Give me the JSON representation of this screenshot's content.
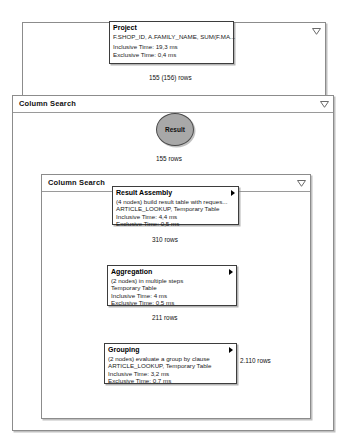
{
  "diagram": {
    "type": "sql-execution-plan",
    "containers": [
      {
        "id": "outer-top",
        "title": "",
        "collapse_icon": "chevron-down-icon"
      },
      {
        "id": "column-search-outer",
        "title": "Column Search",
        "collapse_icon": "chevron-down-icon"
      },
      {
        "id": "column-search-inner",
        "title": "Column Search",
        "collapse_icon": "chevron-down-icon"
      }
    ],
    "nodes": [
      {
        "id": "project",
        "title": "Project",
        "detail": "F.SHOP_ID, A.FAMILY_NAME, SUM(F.MA...",
        "detail2": "",
        "inclusive": "Inclusive Time: 19,3 ms",
        "exclusive": "Exclusive Time: 0,4 ms",
        "has_expander": false
      },
      {
        "id": "result",
        "title": "Result",
        "shape": "ellipse"
      },
      {
        "id": "result-assembly",
        "title": "Result Assembly",
        "detail": "(4 nodes) build result table with reques...",
        "detail2": "ARTICLE_LOOKUP, Temporary Table",
        "inclusive": "Inclusive Time: 4,4 ms",
        "exclusive": "Exclusive Time: 0,5 ms",
        "has_expander": true
      },
      {
        "id": "aggregation",
        "title": "Aggregation",
        "detail": "(2 nodes) in multiple steps",
        "detail2": "Temporary Table",
        "inclusive": "Inclusive Time: 4 ms",
        "exclusive": "Exclusive Time: 0,5 ms",
        "has_expander": true
      },
      {
        "id": "grouping",
        "title": "Grouping",
        "detail": "(2 nodes) evaluate a group by clause",
        "detail2": "ARTICLE_LOOKUP, Temporary Table",
        "inclusive": "Inclusive Time: 3,2 ms",
        "exclusive": "Exclusive Time: 0,7 ms",
        "has_expander": true
      }
    ],
    "edge_labels": {
      "project_from_result": "155 (156) rows",
      "result_from_assembly": "155 rows",
      "assembly_from_aggregation": "310 rows",
      "aggregation_from_grouping": "211 rows",
      "grouping_out": "2.110 rows"
    },
    "colors": {
      "node_border": "#3d3d3d",
      "frame_border": "#8c8c8c",
      "result_fill": "#a8a8a8",
      "edge": "#4a4a4a",
      "background": "#ffffff"
    }
  }
}
